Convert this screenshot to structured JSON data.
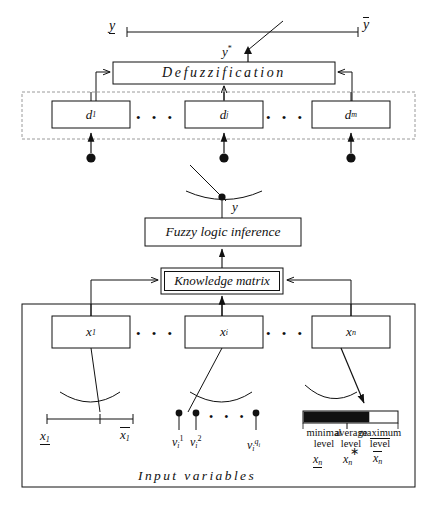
{
  "figure": {
    "type": "block-diagram",
    "caption": ""
  },
  "output_scale": {
    "name": "output-range-scale",
    "min_label": "y",
    "min_decoration": "underline",
    "max_label": "y",
    "max_decoration": "overline",
    "pointer_label": "y",
    "pointer_superscript": "*"
  },
  "blocks": {
    "defuzzification": {
      "label": "Defuzzification",
      "style": "single-border"
    },
    "fuzzy_inference": {
      "label": "Fuzzy logic inference",
      "style": "single-border"
    },
    "knowledge_matrix": {
      "label": "Knowledge matrix",
      "style": "double-border"
    }
  },
  "output_terms": {
    "container_style": "dashed",
    "items": [
      {
        "base": "d",
        "subscript": "1"
      },
      {
        "base": "d",
        "subscript": "j"
      },
      {
        "base": "d",
        "subscript": "m"
      }
    ],
    "ellipsis": "• • •"
  },
  "inference_node": {
    "label": "y",
    "style": "switch-contact"
  },
  "input_section": {
    "container_style": "solid",
    "footer_label": "Input variables",
    "variables": [
      {
        "base": "x",
        "subscript": "1"
      },
      {
        "base": "x",
        "subscript": "i"
      },
      {
        "base": "x",
        "subscript": "n"
      }
    ],
    "ellipsis": "• • •"
  },
  "input_scales": {
    "continuous": {
      "name": "continuous-interval-scale",
      "min_label": "x",
      "min_subscript": "1",
      "min_decoration": "underline",
      "max_label": "x",
      "max_subscript": "1",
      "max_decoration": "overline",
      "marker_position_pct": 62
    },
    "discrete": {
      "name": "discrete-levels-scale",
      "ticks": [
        {
          "base": "v",
          "subscript": "i",
          "superscript": "1"
        },
        {
          "base": "v",
          "subscript": "i",
          "superscript": "2"
        },
        {
          "base": "v",
          "subscript": "i",
          "superscript": "q",
          "superscript_sub": "i"
        }
      ],
      "ellipsis": "• • •"
    },
    "bar": {
      "name": "level-bar-scale",
      "fill_pct": 70,
      "fill_color": "#111111",
      "empty_color": "#ffffff",
      "levels": [
        {
          "line1": "minimal",
          "line2": "level",
          "line2_decoration": "none",
          "var_base": "x",
          "var_subscript": "n",
          "var_decoration": "underline"
        },
        {
          "line1": "average",
          "line2": "level",
          "line2_decoration": "none",
          "var_base": "x",
          "var_subscript": "n",
          "var_decoration": "star"
        },
        {
          "line1": "maximum",
          "line2": "level",
          "line2_decoration": "overline",
          "var_base": "x",
          "var_subscript": "n",
          "var_decoration": "overline"
        }
      ]
    }
  },
  "colors": {
    "ink": "#111111",
    "paper": "#ffffff",
    "dashed": "#999999"
  }
}
